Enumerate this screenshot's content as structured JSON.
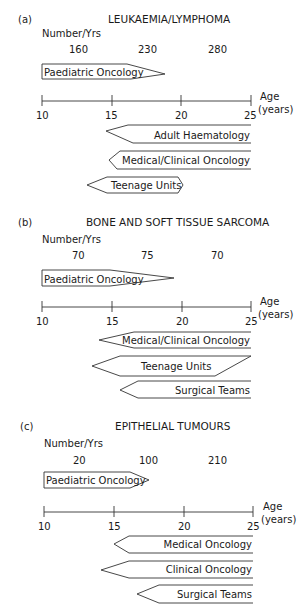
{
  "panels": [
    {
      "id": "a",
      "label": "(a)",
      "title": "LEUKAEMIA/LYMPHOMA",
      "number_label": "Number/Yrs",
      "numbers": [
        "160",
        "230",
        "280"
      ],
      "paediatric": "Paediatric Oncology",
      "axis_ticks": [
        "10",
        "15",
        "20",
        "25"
      ],
      "axis_label_1": "Age",
      "axis_label_2": "(years)",
      "services": [
        "Adult Haematology",
        "Medical/Clinical Oncology",
        "Teenage Units"
      ]
    },
    {
      "id": "b",
      "label": "(b)",
      "title": "BONE AND SOFT TISSUE SARCOMA",
      "number_label": "Number/Yrs",
      "numbers": [
        "70",
        "75",
        "70"
      ],
      "paediatric": "Paediatric Oncology",
      "axis_ticks": [
        "10",
        "15",
        "20",
        "25"
      ],
      "axis_label_1": "Age",
      "axis_label_2": "(years)",
      "services": [
        "Medical/Clinical Oncology",
        "Teenage Units",
        "Surgical Teams"
      ]
    },
    {
      "id": "c",
      "label": "(c)",
      "title": "EPITHELIAL TUMOURS",
      "number_label": "Number/Yrs",
      "numbers": [
        "20",
        "100",
        "210"
      ],
      "paediatric": "Paediatric Oncology",
      "axis_ticks": [
        "10",
        "15",
        "20",
        "25"
      ],
      "axis_label_1": "Age",
      "axis_label_2": "(years)",
      "services": [
        "Medical Oncology",
        "Clinical Oncology",
        "Surgical Teams"
      ]
    }
  ]
}
